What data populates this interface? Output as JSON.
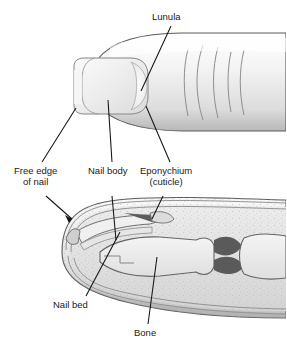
{
  "figure": {
    "type": "anatomical-diagram",
    "views": [
      {
        "name": "dorsal-view",
        "description": "Top view of fingertip showing nail plate"
      },
      {
        "name": "sagittal-section",
        "description": "Cut-away side view of fingertip showing nail bed and bone"
      }
    ]
  },
  "labels": {
    "lunula": "Lunula",
    "free_edge_line1": "Free edge",
    "free_edge_line2": "of nail",
    "nail_body": "Nail body",
    "eponychium_line1": "Eponychium",
    "eponychium_line2": "(cuticle)",
    "nail_bed": "Nail bed",
    "bone": "Bone"
  },
  "colors": {
    "outline": "#4a4a4a",
    "leader_line": "#1a1a1a",
    "skin_light": "#f2f2f2",
    "skin_mid": "#d8d8d8",
    "skin_shadow": "#9a9a9a",
    "nail_plate": "#e8e8e8",
    "tissue": "#e0e0e0",
    "bone_fill": "#ededed",
    "joint_dark": "#555555",
    "rule": "#808080",
    "background": "#ffffff"
  }
}
